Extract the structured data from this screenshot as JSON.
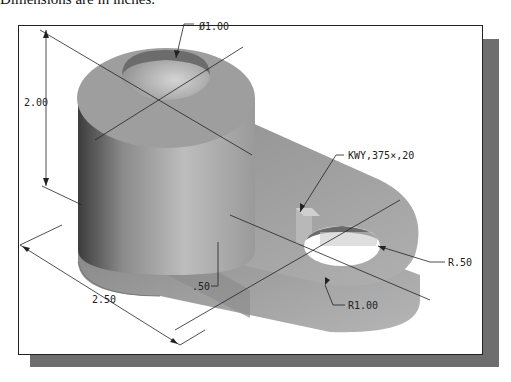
{
  "caption": "Dimensions are in inches.",
  "figure": {
    "type": "isometric part drawing",
    "dimensions": {
      "hole_diameter": "Ø1.00",
      "height": "2.00",
      "key": "KWY,375×,20",
      "small_radius": "R.50",
      "large_radius": "R1.00",
      "length": "2.50",
      "thickness": ".50"
    }
  },
  "colors": {
    "frame_shadow": "#6e6e6e",
    "part_light": "#c8c8c8",
    "part_mid": "#9a9a9a",
    "part_dark": "#5a5a5a",
    "line": "#222222"
  }
}
